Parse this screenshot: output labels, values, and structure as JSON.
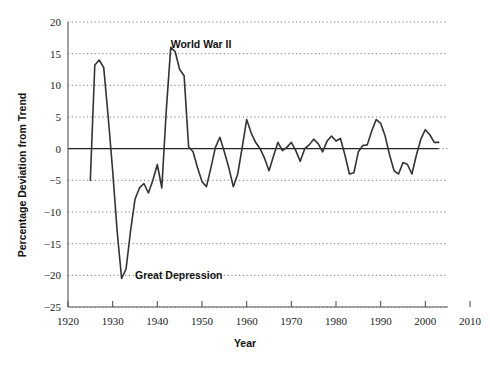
{
  "chart_data": {
    "type": "line",
    "title": "",
    "xlabel": "Year",
    "ylabel": "Percentage Deviation from Trend",
    "xlim": [
      1920,
      2010
    ],
    "ylim": [
      -25,
      20
    ],
    "grid": true,
    "legend": "none",
    "xticks": [
      1920,
      1930,
      1940,
      1950,
      1960,
      1970,
      1980,
      1990,
      2000,
      2010
    ],
    "xtick_labels": [
      "1920",
      "1930",
      "1940",
      "1950",
      "1960",
      "1970",
      "1980",
      "1990",
      "2000",
      "2010"
    ],
    "yticks": [
      20,
      15,
      10,
      5,
      0,
      -5,
      -10,
      -15,
      -20,
      -25
    ],
    "ytick_labels": [
      "20",
      "15",
      "10",
      "5",
      "0",
      "−5",
      "−10",
      "−15",
      "−20",
      "−25"
    ],
    "zero_line": 0,
    "series": [
      {
        "name": "Percentage Deviation from Trend",
        "color": "#333333",
        "x": [
          1925,
          1926,
          1927,
          1928,
          1929,
          1930,
          1931,
          1932,
          1933,
          1934,
          1935,
          1936,
          1937,
          1938,
          1939,
          1940,
          1941,
          1942,
          1943,
          1944,
          1945,
          1946,
          1947,
          1948,
          1949,
          1950,
          1951,
          1952,
          1953,
          1954,
          1955,
          1956,
          1957,
          1958,
          1959,
          1960,
          1961,
          1962,
          1963,
          1964,
          1965,
          1966,
          1967,
          1968,
          1969,
          1970,
          1971,
          1972,
          1973,
          1974,
          1975,
          1976,
          1977,
          1978,
          1979,
          1980,
          1981,
          1982,
          1983,
          1984,
          1985,
          1986,
          1987,
          1988,
          1989,
          1990,
          1991,
          1992,
          1993,
          1994,
          1995,
          1996,
          1997,
          1998,
          1999,
          2000,
          2001,
          2002,
          2003
        ],
        "y": [
          -5.0,
          13.2,
          14.0,
          12.8,
          5.0,
          -3.5,
          -13.0,
          -20.5,
          -19.0,
          -13.0,
          -8.0,
          -6.2,
          -5.5,
          -7.0,
          -5.0,
          -2.5,
          -6.2,
          6.0,
          16.0,
          15.3,
          12.5,
          11.5,
          0.3,
          -0.5,
          -3.0,
          -5.2,
          -6.0,
          -3.0,
          0.2,
          1.8,
          -0.5,
          -3.0,
          -6.0,
          -4.0,
          0.2,
          4.6,
          2.5,
          1.0,
          0.0,
          -1.5,
          -3.5,
          -1.2,
          1.0,
          -0.3,
          0.2,
          1.0,
          -0.3,
          -2.0,
          0.0,
          0.6,
          1.5,
          0.8,
          -0.5,
          1.2,
          2.0,
          1.2,
          1.6,
          -1.0,
          -4.0,
          -3.8,
          -0.5,
          0.5,
          0.6,
          2.8,
          4.6,
          4.0,
          2.0,
          -1.0,
          -3.5,
          -4.0,
          -2.2,
          -2.5,
          -4.0,
          -1.0,
          1.5,
          3.0,
          2.2,
          1.0,
          1.0
        ]
      }
    ],
    "annotations": [
      {
        "text": "World War II",
        "x": 1943,
        "y": 16.5
      },
      {
        "text": "Great Depression",
        "x": 1935,
        "y": -20.0
      }
    ]
  },
  "figure": {
    "background_color": "#ffffff",
    "line_color": "#333333",
    "grid_color": "#7a7a7a",
    "axis_color": "#555555",
    "text_color": "#111111"
  }
}
